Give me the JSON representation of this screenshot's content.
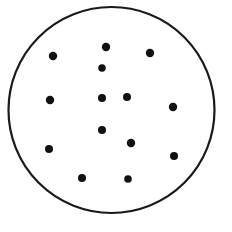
{
  "figure": {
    "canvas": {
      "width": 232,
      "height": 232,
      "background_color": "#ffffff"
    },
    "circle": {
      "name": "outer-circle",
      "center_x": 111.5,
      "center_y": 110,
      "radius": 103,
      "stroke_color": "#1a1a1a",
      "stroke_width": 2.2,
      "fill_color": "none"
    },
    "dots": {
      "count": 14,
      "radius": 4,
      "fill_color": "#111111",
      "points": [
        {
          "label": "dot-1",
          "x": 106,
          "y": 47,
          "r": 4.2
        },
        {
          "label": "dot-2",
          "x": 53,
          "y": 56,
          "r": 4.2
        },
        {
          "label": "dot-3",
          "x": 150,
          "y": 53,
          "r": 4.2
        },
        {
          "label": "dot-4",
          "x": 102,
          "y": 68,
          "r": 3.8
        },
        {
          "label": "dot-5",
          "x": 50,
          "y": 100,
          "r": 4.2
        },
        {
          "label": "dot-6",
          "x": 102,
          "y": 98,
          "r": 4.0
        },
        {
          "label": "dot-7",
          "x": 127,
          "y": 97,
          "r": 4.0
        },
        {
          "label": "dot-8",
          "x": 173,
          "y": 107,
          "r": 4.2
        },
        {
          "label": "dot-9",
          "x": 102,
          "y": 130,
          "r": 4.0
        },
        {
          "label": "dot-10",
          "x": 49,
          "y": 149,
          "r": 4.0
        },
        {
          "label": "dot-11",
          "x": 131,
          "y": 143,
          "r": 4.2
        },
        {
          "label": "dot-12",
          "x": 174,
          "y": 156,
          "r": 4.0
        },
        {
          "label": "dot-13",
          "x": 82,
          "y": 178,
          "r": 4.0
        },
        {
          "label": "dot-14",
          "x": 128,
          "y": 179,
          "r": 3.8
        }
      ]
    }
  }
}
